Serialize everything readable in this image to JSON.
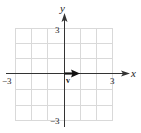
{
  "diagram": {
    "type": "vector-on-coordinate-grid",
    "axes": {
      "x_label": "x",
      "y_label": "y",
      "x_range": [
        -3,
        3
      ],
      "y_range": [
        -3,
        3
      ],
      "tick_labels": {
        "x_min": "−3",
        "x_max": "3",
        "y_min": "−3",
        "y_max": "3"
      }
    },
    "grid": {
      "columns": 6,
      "rows": 6,
      "color": "#d9d9d9"
    },
    "vector": {
      "label": "v",
      "from": [
        0,
        0
      ],
      "to": [
        1,
        0
      ],
      "color": "#111111"
    },
    "colors": {
      "axis": "#333333",
      "text": "#222222"
    }
  }
}
